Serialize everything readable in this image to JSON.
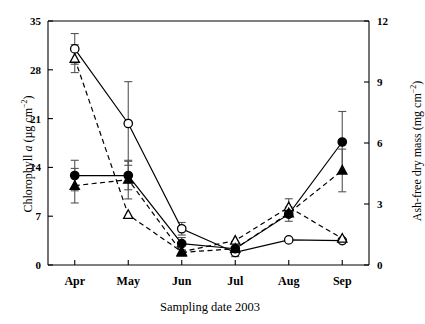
{
  "chart_data": {
    "type": "line",
    "title": "",
    "xlabel": "Sampling date 2003",
    "ylabel": "Chlorophyll a (µg cm⁻²)",
    "ylabel_right": "Ash-free dry mass (mg cm⁻²)",
    "categories": [
      "Apr",
      "May",
      "Jun",
      "Jul",
      "Aug",
      "Sep"
    ],
    "ylim": [
      0,
      35
    ],
    "yticks": [
      0,
      7,
      14,
      21,
      28,
      35
    ],
    "ylim_right": [
      0,
      12
    ],
    "yticks_right": [
      0,
      3,
      6,
      9,
      12
    ],
    "grid": false,
    "legend": "none",
    "series": [
      {
        "name": "Chlorophyll a - open circle",
        "marker": "open-circle",
        "line": "solid",
        "axis": "left",
        "values": [
          31.0,
          20.3,
          5.2,
          1.8,
          3.6,
          3.5
        ],
        "errors": [
          2.2,
          6.0,
          0.9,
          0.6,
          0.0,
          0.0
        ]
      },
      {
        "name": "Chlorophyll a - open triangle",
        "marker": "open-triangle",
        "line": "dashed",
        "axis": "left",
        "values": [
          29.6,
          7.2,
          1.9,
          3.5,
          8.3,
          3.8
        ],
        "errors": [
          2.0,
          0.0,
          0.0,
          0.0,
          1.2,
          0.0
        ]
      },
      {
        "name": "Ash-free dry mass - filled circle",
        "marker": "filled-circle",
        "line": "solid",
        "axis": "right",
        "values": [
          4.4,
          4.4,
          1.05,
          0.8,
          2.5,
          6.05
        ],
        "errors": [
          0.75,
          0.7,
          0.3,
          0.0,
          0.35,
          1.5
        ]
      },
      {
        "name": "Ash-free dry mass - filled triangle",
        "marker": "filled-triangle",
        "line": "dashed",
        "axis": "right",
        "values": [
          3.9,
          4.2,
          0.62,
          0.8,
          2.55,
          4.65
        ],
        "errors": [
          0.85,
          0.95,
          0.0,
          0.0,
          0.0,
          1.05
        ]
      }
    ],
    "colors": {
      "ink": "#000000",
      "error_bar": "#555555",
      "background": "#ffffff"
    }
  },
  "axes": {
    "left_ticks": [
      "35",
      "28",
      "21",
      "14",
      "7",
      "0"
    ],
    "right_ticks": [
      "12",
      "9",
      "6",
      "3",
      "0"
    ],
    "x_ticks": [
      "Apr",
      "May",
      "Jun",
      "Jul",
      "Aug",
      "Sep"
    ],
    "x_title": "Sampling date 2003",
    "y_title_left_pre": "Chlorophyll ",
    "y_title_left_ital": "a",
    "y_title_left_post": " (µg cm",
    "y_title_left_sup": "−2",
    "y_title_left_end": ")",
    "y_title_right_pre": "Ash-free dry mass (mg cm",
    "y_title_right_sup": "−2",
    "y_title_right_end": ")"
  }
}
